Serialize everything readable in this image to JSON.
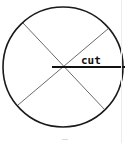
{
  "diagram": {
    "title": "",
    "shape": "circle",
    "circle": {
      "cx": 63,
      "cy": 67,
      "r": 60,
      "stroke": "#1a1a1a",
      "stroke_width": 1.6
    },
    "lines": [
      {
        "name": "diagonal-upper-left-to-lower-right",
        "x1": 23,
        "y1": 23,
        "x2": 105,
        "y2": 110,
        "stroke": "#444444",
        "width": 0.8
      },
      {
        "name": "diagonal-upper-right-to-lower-left",
        "x1": 109,
        "y1": 28,
        "x2": 18,
        "y2": 105,
        "stroke": "#444444",
        "width": 0.8
      },
      {
        "name": "cut-line",
        "x1": 52,
        "y1": 67,
        "x2": 125,
        "y2": 67,
        "stroke": "#111111",
        "width": 1.8
      }
    ],
    "labels": {
      "cut": "cut"
    }
  }
}
